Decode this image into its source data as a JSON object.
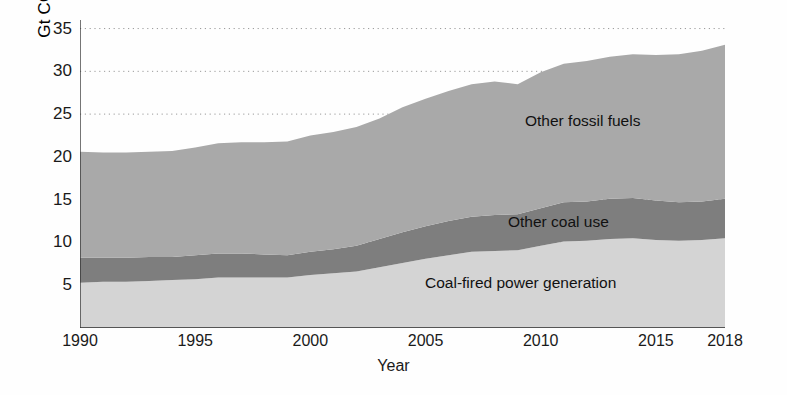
{
  "chart_data": {
    "type": "area",
    "title": "",
    "subtitle": "",
    "xlabel": "Year",
    "ylabel": "Gt CO2",
    "ylabel_base": "Gt CO",
    "ylabel_sub": "2",
    "xlim": [
      1990,
      2018
    ],
    "ylim": [
      0,
      36
    ],
    "yticks": [
      5,
      10,
      15,
      20,
      25,
      30,
      35
    ],
    "xticks": [
      1990,
      1995,
      2000,
      2005,
      2010,
      2015,
      2018
    ],
    "grid": "horizontal-dotted",
    "legend_position": "inline-annotations",
    "stacked": true,
    "colors": {
      "coal_fired_power": "#d4d4d4",
      "other_coal_use": "#7e7e7e",
      "other_fossil_fuels": "#a9a9a9",
      "axis": "#2b2b2b",
      "grid": "#9a9a9a",
      "text": "#1a1a1a",
      "background": "#fefefe"
    },
    "x": [
      1990,
      1991,
      1992,
      1993,
      1994,
      1995,
      1996,
      1997,
      1998,
      1999,
      2000,
      2001,
      2002,
      2003,
      2004,
      2005,
      2006,
      2007,
      2008,
      2009,
      2010,
      2011,
      2012,
      2013,
      2014,
      2015,
      2016,
      2017,
      2018
    ],
    "series": [
      {
        "name": "Coal-fired power generation",
        "values": [
          5.3,
          5.4,
          5.4,
          5.5,
          5.6,
          5.7,
          5.9,
          5.9,
          5.9,
          5.9,
          6.2,
          6.4,
          6.6,
          7.1,
          7.6,
          8.1,
          8.5,
          8.9,
          9.0,
          9.1,
          9.6,
          10.1,
          10.2,
          10.4,
          10.5,
          10.3,
          10.2,
          10.3,
          10.5
        ]
      },
      {
        "name": "Other coal use",
        "values": [
          2.9,
          2.8,
          2.8,
          2.8,
          2.7,
          2.8,
          2.8,
          2.8,
          2.7,
          2.6,
          2.7,
          2.8,
          3.0,
          3.3,
          3.6,
          3.8,
          4.0,
          4.1,
          4.2,
          4.2,
          4.4,
          4.6,
          4.6,
          4.7,
          4.7,
          4.6,
          4.5,
          4.5,
          4.6
        ]
      },
      {
        "name": "Other fossil fuels",
        "values": [
          12.4,
          12.3,
          12.3,
          12.3,
          12.4,
          12.6,
          12.9,
          13.0,
          13.1,
          13.3,
          13.6,
          13.7,
          13.9,
          14.1,
          14.6,
          14.9,
          15.2,
          15.5,
          15.6,
          15.2,
          15.9,
          16.2,
          16.4,
          16.6,
          16.8,
          17.0,
          17.3,
          17.6,
          18.0
        ]
      }
    ],
    "annotations": [
      {
        "label": "Other fossil fuels",
        "x": 2011.5,
        "y": 25.5
      },
      {
        "label": "Other coal use",
        "x": 2010.6,
        "y": 13.6
      },
      {
        "label": "Coal-fired power generation",
        "x": 2006.5,
        "y": 6.3
      }
    ],
    "totals": [
      20.6,
      20.5,
      20.5,
      20.6,
      20.7,
      21.1,
      21.6,
      21.7,
      21.7,
      21.8,
      22.5,
      22.9,
      23.5,
      24.5,
      25.8,
      26.8,
      27.7,
      28.5,
      28.8,
      28.5,
      29.9,
      30.9,
      31.2,
      31.7,
      32.0,
      31.9,
      32.0,
      32.4,
      33.1
    ]
  }
}
